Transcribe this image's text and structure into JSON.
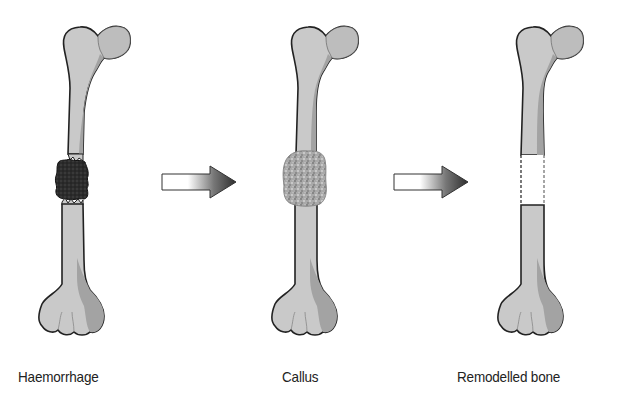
{
  "diagram": {
    "stages": [
      {
        "id": "haemorrhage",
        "label": "Haemorrhage"
      },
      {
        "id": "callus",
        "label": "Callus"
      },
      {
        "id": "remodelled",
        "label": "Remodelled bone"
      }
    ],
    "arrows": [
      {
        "from": "haemorrhage",
        "to": "callus"
      },
      {
        "from": "callus",
        "to": "remodelled"
      }
    ],
    "colors": {
      "bone_fill": "#c8c8c8",
      "bone_shadow": "#9a9a9a",
      "bone_outline": "#222222",
      "haemorrhage": "#333333",
      "callus": "#a8a8a8",
      "arrow_start": "#ffffff",
      "arrow_end": "#333333"
    }
  }
}
